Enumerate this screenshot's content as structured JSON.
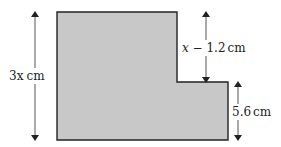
{
  "diagram": {
    "type": "compound-shape",
    "shape": "L-shaped (rectangle with top-right corner removed)",
    "colors": {
      "fill": "#c8c8c8",
      "stroke": "#222222",
      "arrow": "#444444",
      "background": "#ffffff"
    },
    "labels": {
      "left_height": {
        "var": "3x",
        "unit": "cm"
      },
      "step_height": {
        "var": "x",
        "op": " − ",
        "num": "1.2",
        "unit": "cm"
      },
      "right_height": {
        "value": "5.6",
        "unit": "cm"
      }
    }
  }
}
